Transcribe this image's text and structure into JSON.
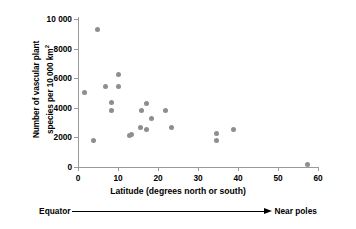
{
  "chart_data": {
    "type": "scatter",
    "title": "",
    "xlabel": "Latitude (degrees north or south)",
    "ylabel_line1": "Number of vascular plant",
    "ylabel_line2_prefix": "species per 10 000 km",
    "ylabel_line2_sup": "2",
    "xlim": [
      0,
      60
    ],
    "ylim": [
      0,
      10000
    ],
    "grid": false,
    "legend": null,
    "xticks": [
      "0",
      "10",
      "20",
      "30",
      "40",
      "50",
      "60"
    ],
    "xtick_values": [
      0,
      10,
      20,
      30,
      40,
      50,
      60
    ],
    "yticks": [
      "0",
      "2000",
      "4000",
      "6000",
      "8000",
      "10 000"
    ],
    "ytick_values": [
      0,
      2000,
      4000,
      6000,
      8000,
      10000
    ],
    "marker_color": "#8e8e8e",
    "axis_color": "#9a9a9a",
    "points": [
      {
        "x": 1.5,
        "y": 5050
      },
      {
        "x": 3.9,
        "y": 1790
      },
      {
        "x": 4.9,
        "y": 9300
      },
      {
        "x": 6.8,
        "y": 5430
      },
      {
        "x": 8.4,
        "y": 4350
      },
      {
        "x": 8.4,
        "y": 3830
      },
      {
        "x": 10.0,
        "y": 6280
      },
      {
        "x": 10.1,
        "y": 5440
      },
      {
        "x": 12.9,
        "y": 2120
      },
      {
        "x": 13.4,
        "y": 2200
      },
      {
        "x": 15.7,
        "y": 2650
      },
      {
        "x": 15.8,
        "y": 3800
      },
      {
        "x": 17.1,
        "y": 4260
      },
      {
        "x": 17.2,
        "y": 2560
      },
      {
        "x": 18.3,
        "y": 3310
      },
      {
        "x": 21.9,
        "y": 3790
      },
      {
        "x": 23.3,
        "y": 2650
      },
      {
        "x": 34.6,
        "y": 2250
      },
      {
        "x": 34.7,
        "y": 1790
      },
      {
        "x": 38.8,
        "y": 2540
      },
      {
        "x": 57.4,
        "y": 200
      }
    ]
  },
  "annotation": {
    "left_label": "Equator",
    "right_label": "Near poles",
    "arrow": "right-arrow"
  }
}
